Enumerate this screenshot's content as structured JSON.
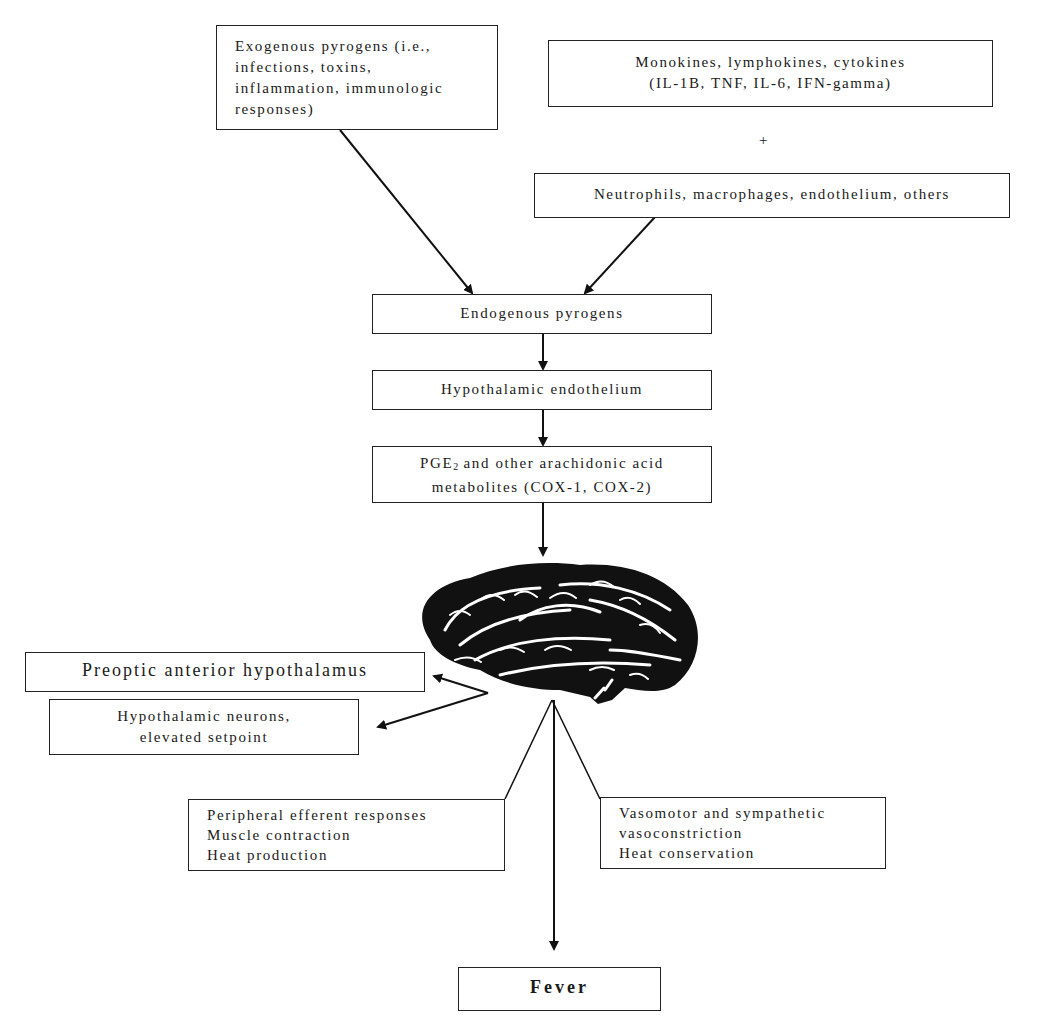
{
  "diagram": {
    "nodes": {
      "exogenous": {
        "lines": [
          "Exogenous pyrogens (i.e.,",
          "infections, toxins,",
          "inflammation, immunologic",
          "responses)"
        ]
      },
      "cytokines": {
        "lines": [
          "Monokines, lymphokines, cytokines",
          "(IL-1B, TNF, IL-6, IFN-gamma)"
        ]
      },
      "plus_sign": "+",
      "cells": {
        "lines": [
          "Neutrophils, macrophages, endothelium, others"
        ]
      },
      "endogenous": {
        "lines": [
          "Endogenous pyrogens"
        ]
      },
      "hypothalamic_endothelium": {
        "lines": [
          "Hypothalamic endothelium"
        ]
      },
      "pge2": {
        "prefix": "PGE",
        "subscript": "2",
        "suffix": " and other arachidonic acid",
        "line2": "metabolites (COX-1, COX-2)"
      },
      "brain": {
        "icon": "brain-illustration"
      },
      "preoptic": {
        "lines": [
          "Preoptic anterior hypothalamus"
        ]
      },
      "neurons": {
        "lines": [
          "Hypothalamic neurons,",
          "elevated setpoint"
        ]
      },
      "peripheral": {
        "lines": [
          "Peripheral efferent responses",
          "Muscle contraction",
          "Heat production"
        ]
      },
      "vasomotor": {
        "lines": [
          "Vasomotor and sympathetic",
          "vasoconstriction",
          "Heat conservation"
        ]
      },
      "fever": {
        "lines": [
          "Fever"
        ]
      }
    },
    "edges": [
      {
        "from": "exogenous",
        "to": "endogenous"
      },
      {
        "from": "cells",
        "to": "endogenous"
      },
      {
        "from": "endogenous",
        "to": "hypothalamic_endothelium"
      },
      {
        "from": "hypothalamic_endothelium",
        "to": "pge2"
      },
      {
        "from": "pge2",
        "to": "brain"
      },
      {
        "from": "brain",
        "to": "preoptic"
      },
      {
        "from": "brain",
        "to": "neurons"
      },
      {
        "from": "brain",
        "to": "peripheral"
      },
      {
        "from": "brain",
        "to": "vasomotor"
      },
      {
        "from": "brain",
        "to": "fever"
      }
    ]
  }
}
